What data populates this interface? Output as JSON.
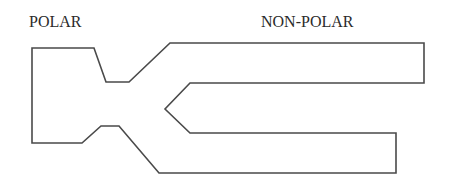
{
  "diagram": {
    "labels": {
      "left": "POLAR",
      "right": "NON-POLAR"
    },
    "colors": {
      "stroke": "#4a4a4a",
      "text": "#2a2a2a",
      "background": "#ffffff"
    }
  }
}
